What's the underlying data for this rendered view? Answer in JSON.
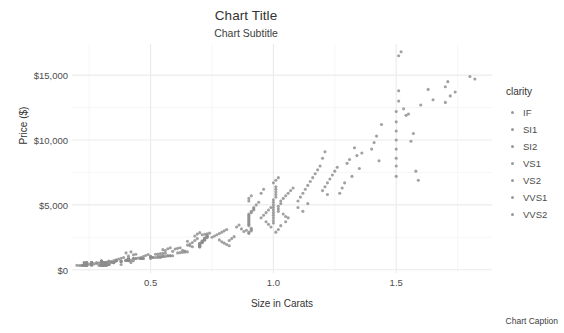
{
  "chart_data": {
    "type": "scatter",
    "title": "Chart Title",
    "subtitle": "Chart Subtitle",
    "caption": "Chart Caption",
    "xlabel": "Size in Carats",
    "ylabel": "Price ($)",
    "xlim": [
      0.18,
      1.89
    ],
    "ylim": [
      -250,
      17400
    ],
    "grid": true,
    "x_ticks": [
      {
        "value": 0.5,
        "label": "0.5"
      },
      {
        "value": 1.0,
        "label": "1.0"
      },
      {
        "value": 1.5,
        "label": "1.5"
      }
    ],
    "x_minor_ticks": [
      0.25,
      0.75,
      1.25,
      1.75
    ],
    "y_ticks": [
      {
        "value": 0,
        "label": "$0"
      },
      {
        "value": 5000,
        "label": "$5,000"
      },
      {
        "value": 10000,
        "label": "$10,000"
      },
      {
        "value": 15000,
        "label": "$15,000"
      }
    ],
    "y_minor_ticks": [
      2500,
      7500,
      12500
    ],
    "point_color": "#8c8c8c",
    "point_size": 3.1,
    "legend": {
      "title": "clarity",
      "position": "right",
      "entries": [
        {
          "label": "IF",
          "color": "#9a9a9a"
        },
        {
          "label": "SI1",
          "color": "#9a9a9a"
        },
        {
          "label": "SI2",
          "color": "#9a9a9a"
        },
        {
          "label": "VS1",
          "color": "#9a9a9a"
        },
        {
          "label": "VS2",
          "color": "#9a9a9a"
        },
        {
          "label": "VVS1",
          "color": "#9a9a9a"
        },
        {
          "label": "VVS2",
          "color": "#9a9a9a"
        }
      ]
    },
    "points": [
      [
        0.23,
        326
      ],
      [
        0.21,
        327
      ],
      [
        0.23,
        335
      ],
      [
        0.29,
        334
      ],
      [
        0.31,
        335
      ],
      [
        0.24,
        336
      ],
      [
        0.24,
        336
      ],
      [
        0.26,
        337
      ],
      [
        0.22,
        337
      ],
      [
        0.23,
        338
      ],
      [
        0.3,
        339
      ],
      [
        0.23,
        340
      ],
      [
        0.22,
        342
      ],
      [
        0.31,
        344
      ],
      [
        0.2,
        345
      ],
      [
        0.32,
        345
      ],
      [
        0.3,
        348
      ],
      [
        0.3,
        351
      ],
      [
        0.3,
        351
      ],
      [
        0.3,
        352
      ],
      [
        0.23,
        353
      ],
      [
        0.23,
        353
      ],
      [
        0.31,
        354
      ],
      [
        0.31,
        355
      ],
      [
        0.23,
        357
      ],
      [
        0.24,
        357
      ],
      [
        0.3,
        357
      ],
      [
        0.23,
        402
      ],
      [
        0.23,
        402
      ],
      [
        0.31,
        402
      ],
      [
        0.24,
        404
      ],
      [
        0.3,
        405
      ],
      [
        0.23,
        552
      ],
      [
        0.23,
        552
      ],
      [
        0.26,
        554
      ],
      [
        0.33,
        403
      ],
      [
        0.33,
        403
      ],
      [
        0.33,
        403
      ],
      [
        0.26,
        403
      ],
      [
        0.26,
        403
      ],
      [
        0.26,
        404
      ],
      [
        0.38,
        404
      ],
      [
        0.26,
        405
      ],
      [
        0.24,
        553
      ],
      [
        0.24,
        553
      ],
      [
        0.26,
        554
      ],
      [
        0.26,
        554
      ],
      [
        0.26,
        554
      ],
      [
        0.32,
        554
      ],
      [
        0.32,
        554
      ],
      [
        0.35,
        552
      ],
      [
        0.35,
        552
      ],
      [
        0.35,
        553
      ],
      [
        0.35,
        554
      ],
      [
        0.26,
        556
      ],
      [
        0.38,
        645
      ],
      [
        0.38,
        645
      ],
      [
        0.38,
        645
      ],
      [
        0.4,
        720
      ],
      [
        0.4,
        720
      ],
      [
        0.4,
        720
      ],
      [
        0.32,
        345
      ],
      [
        0.32,
        345
      ],
      [
        0.34,
        575
      ],
      [
        0.34,
        575
      ],
      [
        0.3,
        625
      ],
      [
        0.3,
        625
      ],
      [
        0.3,
        625
      ],
      [
        0.3,
        625
      ],
      [
        0.42,
        552
      ],
      [
        0.28,
        553
      ],
      [
        0.32,
        553
      ],
      [
        0.31,
        554
      ],
      [
        0.31,
        554
      ],
      [
        0.24,
        554
      ],
      [
        0.3,
        680
      ],
      [
        0.3,
        680
      ],
      [
        0.3,
        680
      ],
      [
        0.3,
        680
      ],
      [
        0.33,
        680
      ],
      [
        0.36,
        698
      ],
      [
        0.36,
        698
      ],
      [
        0.36,
        698
      ],
      [
        0.41,
        698
      ],
      [
        0.43,
        698
      ],
      [
        0.4,
        720
      ],
      [
        0.41,
        720
      ],
      [
        0.41,
        720
      ],
      [
        0.41,
        720
      ],
      [
        0.42,
        720
      ],
      [
        0.41,
        843
      ],
      [
        0.41,
        843
      ],
      [
        0.41,
        843
      ],
      [
        0.41,
        843
      ],
      [
        0.41,
        843
      ],
      [
        0.43,
        862
      ],
      [
        0.43,
        862
      ],
      [
        0.44,
        862
      ],
      [
        0.44,
        862
      ],
      [
        0.46,
        862
      ],
      [
        0.46,
        870
      ],
      [
        0.46,
        870
      ],
      [
        0.47,
        870
      ],
      [
        0.47,
        870
      ],
      [
        0.5,
        870
      ],
      [
        0.51,
        945
      ],
      [
        0.51,
        945
      ],
      [
        0.52,
        945
      ],
      [
        0.53,
        945
      ],
      [
        0.54,
        945
      ],
      [
        0.5,
        1000
      ],
      [
        0.5,
        1000
      ],
      [
        0.5,
        1000
      ],
      [
        0.5,
        1000
      ],
      [
        0.5,
        1000
      ],
      [
        0.53,
        1029
      ],
      [
        0.54,
        1029
      ],
      [
        0.55,
        1029
      ],
      [
        0.55,
        1029
      ],
      [
        0.56,
        1029
      ],
      [
        0.57,
        1080
      ],
      [
        0.57,
        1080
      ],
      [
        0.58,
        1080
      ],
      [
        0.58,
        1080
      ],
      [
        0.59,
        1080
      ],
      [
        0.52,
        1200
      ],
      [
        0.53,
        1220
      ],
      [
        0.54,
        1240
      ],
      [
        0.55,
        1260
      ],
      [
        0.56,
        1280
      ],
      [
        0.61,
        1300
      ],
      [
        0.62,
        1320
      ],
      [
        0.63,
        1340
      ],
      [
        0.64,
        1360
      ],
      [
        0.65,
        1380
      ],
      [
        0.7,
        1750
      ],
      [
        0.7,
        1780
      ],
      [
        0.7,
        1810
      ],
      [
        0.7,
        1840
      ],
      [
        0.7,
        1870
      ],
      [
        0.7,
        1900
      ],
      [
        0.7,
        1930
      ],
      [
        0.7,
        1960
      ],
      [
        0.7,
        2000
      ],
      [
        0.7,
        2040
      ],
      [
        0.71,
        2080
      ],
      [
        0.71,
        2120
      ],
      [
        0.71,
        2160
      ],
      [
        0.71,
        2200
      ],
      [
        0.71,
        2240
      ],
      [
        0.72,
        2280
      ],
      [
        0.72,
        2320
      ],
      [
        0.72,
        2360
      ],
      [
        0.72,
        2400
      ],
      [
        0.72,
        2440
      ],
      [
        0.73,
        2480
      ],
      [
        0.73,
        2520
      ],
      [
        0.73,
        2560
      ],
      [
        0.73,
        2600
      ],
      [
        0.73,
        2640
      ],
      [
        0.71,
        2700
      ],
      [
        0.72,
        2740
      ],
      [
        0.73,
        2780
      ],
      [
        0.74,
        2820
      ],
      [
        0.7,
        2860
      ],
      [
        0.6,
        1600
      ],
      [
        0.61,
        1650
      ],
      [
        0.62,
        1700
      ],
      [
        0.63,
        1500
      ],
      [
        0.64,
        1450
      ],
      [
        0.65,
        1900
      ],
      [
        0.66,
        1850
      ],
      [
        0.67,
        2100
      ],
      [
        0.68,
        2250
      ],
      [
        0.69,
        2400
      ],
      [
        0.75,
        2500
      ],
      [
        0.76,
        2600
      ],
      [
        0.77,
        2700
      ],
      [
        0.78,
        2800
      ],
      [
        0.79,
        2900
      ],
      [
        0.8,
        3000
      ],
      [
        0.81,
        3100
      ],
      [
        0.82,
        2250
      ],
      [
        0.83,
        2400
      ],
      [
        0.84,
        2550
      ],
      [
        0.9,
        3400
      ],
      [
        0.9,
        3500
      ],
      [
        0.9,
        3600
      ],
      [
        0.9,
        3700
      ],
      [
        0.9,
        3800
      ],
      [
        0.9,
        3900
      ],
      [
        0.9,
        4000
      ],
      [
        0.9,
        4100
      ],
      [
        0.9,
        4200
      ],
      [
        0.9,
        4300
      ],
      [
        0.91,
        4400
      ],
      [
        0.91,
        4500
      ],
      [
        0.91,
        3200
      ],
      [
        0.91,
        3100
      ],
      [
        0.91,
        3000
      ],
      [
        0.9,
        2900
      ],
      [
        0.9,
        2800
      ],
      [
        0.92,
        4600
      ],
      [
        0.92,
        4700
      ],
      [
        0.92,
        4800
      ],
      [
        0.9,
        5300
      ],
      [
        0.9,
        5500
      ],
      [
        0.91,
        5700
      ],
      [
        0.93,
        5000
      ],
      [
        0.94,
        5200
      ],
      [
        0.95,
        4000
      ],
      [
        0.96,
        4200
      ],
      [
        0.97,
        4400
      ],
      [
        0.98,
        4600
      ],
      [
        0.99,
        4800
      ],
      [
        1.0,
        3600
      ],
      [
        1.0,
        3800
      ],
      [
        1.0,
        4000
      ],
      [
        1.0,
        4200
      ],
      [
        1.0,
        4400
      ],
      [
        1.0,
        4600
      ],
      [
        1.0,
        4800
      ],
      [
        1.0,
        5000
      ],
      [
        1.0,
        5200
      ],
      [
        1.0,
        5400
      ],
      [
        1.01,
        5600
      ],
      [
        1.01,
        5800
      ],
      [
        1.01,
        6000
      ],
      [
        1.01,
        6200
      ],
      [
        1.01,
        6400
      ],
      [
        1.02,
        4500
      ],
      [
        1.02,
        4700
      ],
      [
        1.02,
        4900
      ],
      [
        1.03,
        5100
      ],
      [
        1.03,
        5300
      ],
      [
        1.04,
        5500
      ],
      [
        1.05,
        5700
      ],
      [
        1.06,
        5900
      ],
      [
        1.07,
        6100
      ],
      [
        1.08,
        6300
      ],
      [
        1.0,
        6700
      ],
      [
        1.01,
        6900
      ],
      [
        1.02,
        7100
      ],
      [
        1.04,
        4300
      ],
      [
        1.05,
        4100
      ],
      [
        0.85,
        3300
      ],
      [
        0.86,
        3450
      ],
      [
        0.87,
        3150
      ],
      [
        0.88,
        2950
      ],
      [
        0.89,
        3050
      ],
      [
        1.1,
        5300
      ],
      [
        1.11,
        5600
      ],
      [
        1.12,
        5900
      ],
      [
        1.13,
        6200
      ],
      [
        1.14,
        6500
      ],
      [
        1.15,
        6800
      ],
      [
        1.16,
        7100
      ],
      [
        1.17,
        7400
      ],
      [
        1.18,
        7700
      ],
      [
        1.19,
        8000
      ],
      [
        1.2,
        6100
      ],
      [
        1.21,
        6400
      ],
      [
        1.22,
        6700
      ],
      [
        1.23,
        7000
      ],
      [
        1.24,
        7300
      ],
      [
        1.2,
        8600
      ],
      [
        1.21,
        9100
      ],
      [
        1.22,
        5800
      ],
      [
        1.25,
        7600
      ],
      [
        1.26,
        7900
      ],
      [
        1.27,
        5900
      ],
      [
        1.28,
        6300
      ],
      [
        1.29,
        6700
      ],
      [
        1.3,
        8200
      ],
      [
        1.31,
        8500
      ],
      [
        1.32,
        7200
      ],
      [
        1.33,
        9400
      ],
      [
        1.34,
        8800
      ],
      [
        1.35,
        7800
      ],
      [
        1.36,
        9000
      ],
      [
        1.4,
        9300
      ],
      [
        1.41,
        9800
      ],
      [
        1.42,
        10300
      ],
      [
        1.43,
        8400
      ],
      [
        1.44,
        11200
      ],
      [
        1.5,
        7200
      ],
      [
        1.5,
        8000
      ],
      [
        1.5,
        8600
      ],
      [
        1.5,
        9300
      ],
      [
        1.5,
        10000
      ],
      [
        1.5,
        10700
      ],
      [
        1.5,
        11400
      ],
      [
        1.5,
        12200
      ],
      [
        1.51,
        13000
      ],
      [
        1.51,
        13800
      ],
      [
        1.51,
        16500
      ],
      [
        1.52,
        16800
      ],
      [
        1.53,
        12400
      ],
      [
        1.54,
        11900
      ],
      [
        1.55,
        12000
      ],
      [
        1.56,
        9900
      ],
      [
        1.57,
        10500
      ],
      [
        1.58,
        7600
      ],
      [
        1.59,
        6900
      ],
      [
        1.6,
        12700
      ],
      [
        1.63,
        13900
      ],
      [
        1.65,
        13100
      ],
      [
        1.7,
        14100
      ],
      [
        1.71,
        14500
      ],
      [
        1.74,
        13700
      ],
      [
        1.8,
        14900
      ],
      [
        1.82,
        14700
      ],
      [
        1.1,
        4800
      ],
      [
        1.12,
        4500
      ],
      [
        1.14,
        5100
      ],
      [
        0.95,
        5900
      ],
      [
        0.96,
        6200
      ],
      [
        0.97,
        3700
      ],
      [
        0.98,
        3500
      ],
      [
        0.99,
        3300
      ],
      [
        0.78,
        2300
      ],
      [
        0.79,
        2150
      ],
      [
        0.8,
        2050
      ],
      [
        0.81,
        1950
      ],
      [
        0.82,
        1850
      ],
      [
        0.55,
        1550
      ],
      [
        0.56,
        1480
      ],
      [
        0.57,
        1620
      ],
      [
        0.58,
        1700
      ],
      [
        0.59,
        1420
      ],
      [
        0.45,
        900
      ],
      [
        0.46,
        950
      ],
      [
        0.47,
        1020
      ],
      [
        0.48,
        1100
      ],
      [
        0.49,
        1180
      ],
      [
        0.35,
        700
      ],
      [
        0.36,
        760
      ],
      [
        0.37,
        820
      ],
      [
        0.38,
        880
      ],
      [
        0.39,
        940
      ],
      [
        0.27,
        450
      ],
      [
        0.28,
        480
      ],
      [
        0.29,
        510
      ],
      [
        0.25,
        420
      ],
      [
        0.26,
        440
      ],
      [
        0.33,
        600
      ],
      [
        0.34,
        640
      ],
      [
        0.31,
        560
      ],
      [
        0.32,
        580
      ],
      [
        0.3,
        530
      ],
      [
        0.4,
        1300
      ],
      [
        0.42,
        1380
      ],
      [
        0.44,
        1200
      ],
      [
        0.43,
        1150
      ],
      [
        0.41,
        1050
      ],
      [
        0.65,
        2200
      ],
      [
        0.66,
        1980
      ],
      [
        0.67,
        1770
      ],
      [
        0.68,
        2600
      ],
      [
        0.69,
        2750
      ],
      [
        1.01,
        2900
      ],
      [
        1.02,
        3100
      ],
      [
        1.03,
        3400
      ],
      [
        1.05,
        3700
      ],
      [
        1.06,
        4000
      ],
      [
        1.7,
        12900
      ],
      [
        1.72,
        13400
      ]
    ]
  }
}
